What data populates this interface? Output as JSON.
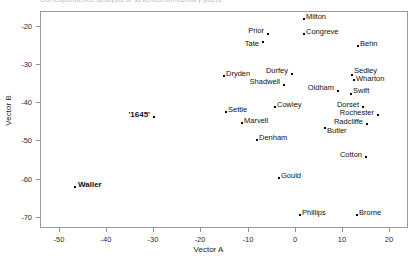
{
  "figure": {
    "clipped_title": "Correspondence analysis of seventeenth-century poets",
    "background_color": "#ffffff",
    "frame_color": "#9a9a9a"
  },
  "chart_data": {
    "type": "scatter",
    "title": "",
    "xlabel": "Vector A",
    "ylabel": "Vector B",
    "xlim": [
      -54,
      24
    ],
    "ylim": [
      -73,
      -16
    ],
    "grid": false,
    "legend": null,
    "xticks": [
      -50,
      -40,
      -30,
      -20,
      -10,
      0,
      10,
      20
    ],
    "xticklabels": [
      "-50",
      "-40",
      "-30",
      "-20",
      "-10",
      "0",
      "10",
      "20"
    ],
    "yticks": [
      -20,
      -30,
      -40,
      -50,
      -60,
      -70
    ],
    "yticklabels": [
      "-20",
      "-30",
      "-40",
      "-50",
      "-60",
      "-70"
    ],
    "marker": "square-dot",
    "marker_color": "#000000",
    "points": [
      {
        "label": "Milton",
        "x": 1.4,
        "y": -21.8,
        "px": 303,
        "py": 18,
        "lx": 306,
        "ly": 17,
        "align": "right",
        "bold": false
      },
      {
        "label": "Congreve",
        "x": 1.4,
        "y": -25.5,
        "px": 303,
        "py": 33,
        "lx": 306,
        "ly": 32,
        "align": "right",
        "bold": false
      },
      {
        "label": "Prior",
        "x": -5.8,
        "y": -25.5,
        "px": 267,
        "py": 33,
        "lx": 264,
        "ly": 31,
        "align": "left",
        "bold": false
      },
      {
        "label": "Tate",
        "x": -6.8,
        "y": -27.5,
        "px": 262,
        "py": 41,
        "lx": 259,
        "ly": 44,
        "align": "left",
        "bold": false
      },
      {
        "label": "Behn",
        "x": 12.2,
        "y": -28.0,
        "px": 357,
        "py": 45,
        "lx": 360,
        "ly": 44,
        "align": "right",
        "bold": false
      },
      {
        "label": "Dryden",
        "x": -14.6,
        "y": -32.8,
        "px": 223,
        "py": 75,
        "lx": 226,
        "ly": 74,
        "align": "right",
        "bold": false
      },
      {
        "label": "Durfey",
        "x": -1.0,
        "y": -32.5,
        "px": 291,
        "py": 73,
        "lx": 288,
        "ly": 71,
        "align": "left",
        "bold": false
      },
      {
        "label": "Sedley",
        "x": 11.0,
        "y": -32.6,
        "px": 351,
        "py": 74,
        "lx": 354,
        "ly": 71,
        "align": "right",
        "bold": false
      },
      {
        "label": "Wharton",
        "x": 11.4,
        "y": -33.6,
        "px": 353,
        "py": 79,
        "lx": 356,
        "ly": 79,
        "align": "right",
        "bold": false
      },
      {
        "label": "Shadwell",
        "x": -2.6,
        "y": -34.8,
        "px": 283,
        "py": 84,
        "lx": 280,
        "ly": 82,
        "align": "left",
        "bold": false
      },
      {
        "label": "Oldham",
        "x": 8.2,
        "y": -36.3,
        "px": 337,
        "py": 90,
        "lx": 334,
        "ly": 88,
        "align": "left",
        "bold": false
      },
      {
        "label": "Swift",
        "x": 10.8,
        "y": -36.8,
        "px": 350,
        "py": 93,
        "lx": 353,
        "ly": 91,
        "align": "right",
        "bold": false
      },
      {
        "label": "Cowley",
        "x": -4.4,
        "y": -40.3,
        "px": 274,
        "py": 106,
        "lx": 277,
        "ly": 105,
        "align": "right",
        "bold": false
      },
      {
        "label": "Dorset",
        "x": 13.0,
        "y": -40.3,
        "px": 362,
        "py": 106,
        "lx": 359,
        "ly": 105,
        "align": "left",
        "bold": false
      },
      {
        "label": "Settle",
        "x": -14.2,
        "y": -41.0,
        "px": 225,
        "py": 111,
        "lx": 228,
        "ly": 110,
        "align": "right",
        "bold": false
      },
      {
        "label": "Rochester",
        "x": 16.0,
        "y": -41.8,
        "px": 377,
        "py": 114,
        "lx": 374,
        "ly": 113,
        "align": "left",
        "bold": false
      },
      {
        "label": "'1645'",
        "x": -28.8,
        "y": -41.9,
        "px": 153,
        "py": 116,
        "lx": 150,
        "ly": 115,
        "align": "left",
        "bold": true
      },
      {
        "label": "Marvell",
        "x": -11.0,
        "y": -43.5,
        "px": 241,
        "py": 122,
        "lx": 244,
        "ly": 121,
        "align": "right",
        "bold": false
      },
      {
        "label": "Radcliffe",
        "x": 13.8,
        "y": -43.8,
        "px": 366,
        "py": 123,
        "lx": 363,
        "ly": 122,
        "align": "left",
        "bold": false
      },
      {
        "label": "Butler",
        "x": 5.6,
        "y": -44.6,
        "px": 324,
        "py": 127,
        "lx": 327,
        "ly": 131,
        "align": "right",
        "bold": false
      },
      {
        "label": "Denham",
        "x": -8.0,
        "y": -46.9,
        "px": 256,
        "py": 139,
        "lx": 259,
        "ly": 138,
        "align": "right",
        "bold": false
      },
      {
        "label": "Cotton",
        "x": 13.6,
        "y": -51.4,
        "px": 365,
        "py": 156,
        "lx": 362,
        "ly": 155,
        "align": "left",
        "bold": false
      },
      {
        "label": "Gould",
        "x": -3.6,
        "y": -54.5,
        "px": 278,
        "py": 177,
        "lx": 281,
        "ly": 176,
        "align": "right",
        "bold": false
      },
      {
        "label": "Waller",
        "x": -43.2,
        "y": -58.2,
        "px": 74,
        "py": 186,
        "lx": 78,
        "ly": 185,
        "align": "right",
        "bold": true
      },
      {
        "label": "Phillips",
        "x": 0.6,
        "y": -66.5,
        "px": 299,
        "py": 214,
        "lx": 302,
        "ly": 213,
        "align": "right",
        "bold": false
      },
      {
        "label": "Brome",
        "x": 12.0,
        "y": -66.5,
        "px": 356,
        "py": 214,
        "lx": 359,
        "ly": 213,
        "align": "right",
        "bold": false
      }
    ]
  }
}
